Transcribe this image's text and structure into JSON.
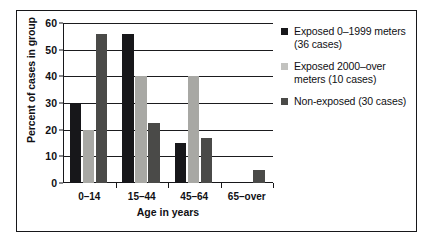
{
  "chart_data": {
    "type": "bar",
    "title": "",
    "subtitle": "",
    "xlabel": "Age in years",
    "ylabel": "Percent of cases in group",
    "categories": [
      "0–14",
      "15–44",
      "45–64",
      "65–over"
    ],
    "series": [
      {
        "name": "Exposed 0–1999 meters (36 cases)",
        "color": "#17171a",
        "values": [
          30,
          56,
          15,
          0
        ]
      },
      {
        "name": "Exposed 2000–over meters (10 cases)",
        "color": "#a8a8a4",
        "values": [
          20,
          40,
          40,
          0
        ]
      },
      {
        "name": "Non-exposed (30 cases)",
        "color": "#4a4a48",
        "values": [
          56,
          22.5,
          17,
          5
        ]
      }
    ],
    "ylim": [
      0,
      60
    ],
    "yticks": [
      0,
      10,
      20,
      30,
      40,
      50,
      60
    ],
    "ytick_labels": [
      "0",
      "10",
      "20",
      "30",
      "40",
      "50",
      "60"
    ],
    "grid": true,
    "legend_position": "right"
  },
  "legend": {
    "items": [
      {
        "line1": "Exposed 0–1999 meters",
        "line2": "(36 cases)"
      },
      {
        "line1": "Exposed 2000–over",
        "line2": "meters (10 cases)"
      },
      {
        "line1": "Non-exposed (30 cases)",
        "line2": ""
      }
    ]
  }
}
